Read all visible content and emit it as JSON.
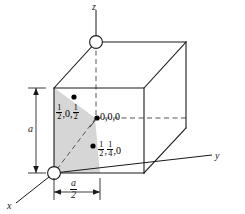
{
  "figure": {
    "cell_edge_label": "a",
    "half_edge_numerator": "a",
    "half_edge_denominator": "2"
  },
  "axes": {
    "x": "x",
    "y": "y",
    "z": "z"
  },
  "points": [
    {
      "name": "origin",
      "label_text": "0,0,0",
      "parts": [
        "0",
        ",",
        "0",
        ",",
        "0"
      ]
    },
    {
      "name": "half-zero-half",
      "label_parts": {
        "first_num": "1",
        "first_den": "2",
        "middle": "0",
        "last_num": "1",
        "last_den": "2"
      }
    },
    {
      "name": "half-quarter-zero",
      "label_parts": {
        "first_num": "1",
        "first_den": "2",
        "middle_num": "1",
        "middle_den": "4",
        "last": "0"
      }
    }
  ],
  "colors": {
    "line": "#1a1a1a",
    "shade": "#d6d6d6",
    "dot": "#000000",
    "background": "#ffffff"
  }
}
